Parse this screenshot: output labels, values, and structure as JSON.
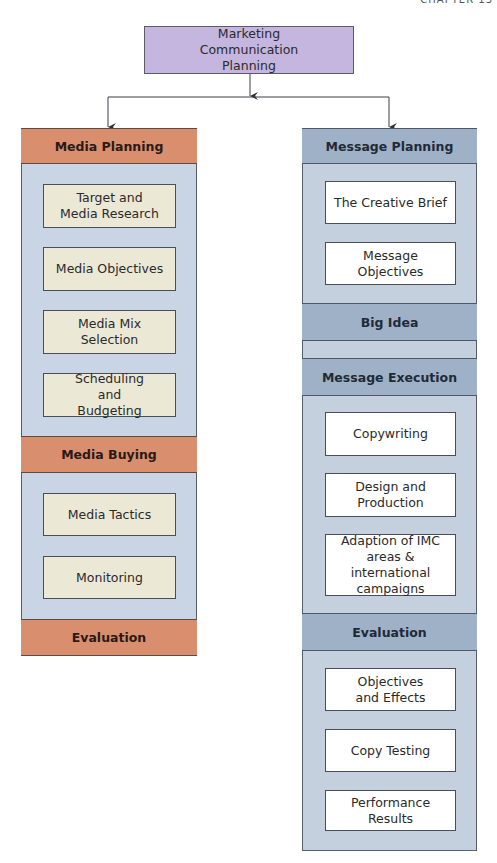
{
  "page": {
    "corner_label": "CHAPTER 13"
  },
  "colors": {
    "top_box": "#c4b6de",
    "media_header": "#d98f6e",
    "message_header": "#9fb1c6",
    "left_panel": "#c9d5e4",
    "right_panel": "#c4d0de",
    "left_step": "#ebe8d6",
    "right_step": "#ffffff"
  },
  "root": {
    "label": "Marketing Communication Planning"
  },
  "left": {
    "sections": [
      {
        "header": "Media Planning",
        "steps": [
          "Target and Media Research",
          "Media Objectives",
          "Media Mix Selection",
          "Scheduling and Budgeting"
        ]
      },
      {
        "header": "Media Buying",
        "steps": [
          "Media Tactics",
          "Monitoring"
        ]
      },
      {
        "header": "Evaluation",
        "steps": []
      }
    ]
  },
  "right": {
    "sections": [
      {
        "header": "Message Planning",
        "steps": [
          "The Creative Brief",
          "Message Objectives"
        ]
      },
      {
        "header": "Big Idea",
        "steps": []
      },
      {
        "header": "Message Execution",
        "steps": [
          "Copywriting",
          "Design and Production",
          "Adaption of IMC areas & international campaigns"
        ]
      },
      {
        "header": "Evaluation",
        "steps": [
          "Objectives and Effects",
          "Copy Testing",
          "Performance Results"
        ]
      }
    ]
  }
}
